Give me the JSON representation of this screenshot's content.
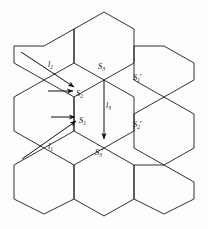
{
  "figure": {
    "type": "geometric-diagram",
    "background_color": "#fdfdfd",
    "stroke_color": "#1a1a1a",
    "text_color": "#111111"
  },
  "vertex_labels": [
    {
      "id": "S2",
      "base": "S",
      "sub": "2",
      "prime": "",
      "text": "S2",
      "x": 77,
      "y": 92
    },
    {
      "id": "S1",
      "base": "S",
      "sub": "1",
      "prime": "",
      "text": "S1",
      "x": 80,
      "y": 119
    },
    {
      "id": "S3",
      "base": "S",
      "sub": "3",
      "prime": "",
      "text": "S3",
      "x": 100,
      "y": 65
    },
    {
      "id": "S1p",
      "base": "S",
      "sub": "1",
      "prime": "′",
      "text": "S1′",
      "x": 135,
      "y": 76
    },
    {
      "id": "S2p",
      "base": "S",
      "sub": "2",
      "prime": "′",
      "text": "S2′",
      "x": 135,
      "y": 123
    },
    {
      "id": "S3p",
      "base": "S",
      "sub": "3",
      "prime": "′",
      "text": "S3′",
      "x": 95,
      "y": 148
    }
  ],
  "vector_labels": [
    {
      "id": "l2",
      "base": "l",
      "sub": "2",
      "text": "l2",
      "x": 49,
      "y": 64
    },
    {
      "id": "l3",
      "base": "l",
      "sub": "3",
      "text": "l3",
      "x": 104,
      "y": 102
    },
    {
      "id": "l1",
      "base": "l",
      "sub": "1",
      "text": "l1",
      "x": 48,
      "y": 145
    }
  ],
  "vectors": [
    {
      "id": "l2-arrow",
      "name": "vector-l2",
      "from": [
        22,
        52
      ],
      "to": [
        76,
        88
      ],
      "arrowhead": true
    },
    {
      "id": "l2-flat-arrow",
      "name": "vector-l2-horizontal",
      "from": [
        47,
        91
      ],
      "to": [
        74,
        91
      ],
      "arrowhead": true
    },
    {
      "id": "l3-arrow",
      "name": "vector-l3",
      "from": [
        104,
        80
      ],
      "to": [
        104,
        141
      ],
      "arrowhead": true
    },
    {
      "id": "l1-arrow",
      "name": "vector-l1",
      "from": [
        24,
        160
      ],
      "to": [
        77,
        120
      ],
      "arrowhead": true
    },
    {
      "id": "l1-flat-arrow",
      "name": "vector-l1-horizontal",
      "from": [
        50,
        117
      ],
      "to": [
        76,
        117
      ],
      "arrowhead": true
    }
  ],
  "hex_grid": {
    "rows": 3,
    "description": "Seven-cell hexagonal cluster of regular flat-top hexagons",
    "cell_count": 10,
    "cell_radius": 34
  }
}
